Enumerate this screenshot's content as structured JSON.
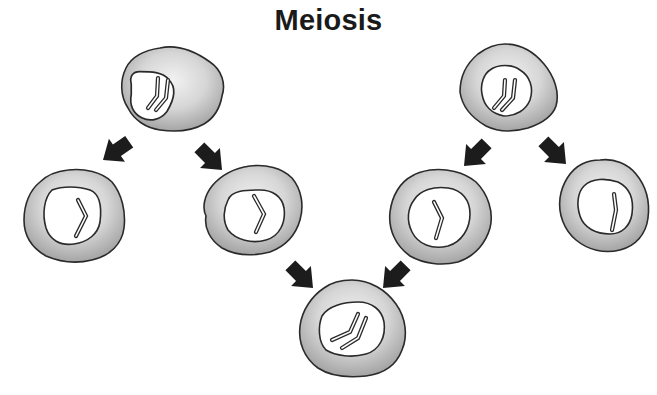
{
  "title": "Meiosis",
  "colors": {
    "outline": "#2a2a2a",
    "cytoplasm_light": "#f0f0f0",
    "cytoplasm_dark": "#a9a9a9",
    "nucleus": "#ffffff",
    "arrow": "#1c1c1c"
  },
  "cells": [
    {
      "id": "parent-cell-left",
      "role": "parent (diploid)",
      "chromosomes": 2
    },
    {
      "id": "parent-cell-right",
      "role": "parent (diploid)",
      "chromosomes": 2
    },
    {
      "id": "gamete-1",
      "role": "gamete (haploid)",
      "chromosomes": 1
    },
    {
      "id": "gamete-2",
      "role": "gamete (haploid)",
      "chromosomes": 1
    },
    {
      "id": "gamete-3",
      "role": "gamete (haploid)",
      "chromosomes": 1
    },
    {
      "id": "gamete-4",
      "role": "gamete (haploid)",
      "chromosomes": 1
    },
    {
      "id": "zygote",
      "role": "zygote (diploid)",
      "chromosomes": 2
    }
  ],
  "arrows": [
    {
      "from": "parent-cell-left",
      "to": "gamete-1"
    },
    {
      "from": "parent-cell-left",
      "to": "gamete-2"
    },
    {
      "from": "parent-cell-right",
      "to": "gamete-3"
    },
    {
      "from": "parent-cell-right",
      "to": "gamete-4"
    },
    {
      "from": "gamete-2",
      "to": "zygote"
    },
    {
      "from": "gamete-3",
      "to": "zygote"
    }
  ]
}
